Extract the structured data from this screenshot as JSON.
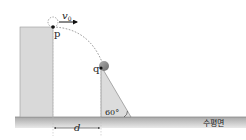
{
  "diagram": {
    "type": "projectile-motion",
    "labels": {
      "launch_point": "p",
      "landing_point": "q",
      "initial_velocity": "v",
      "initial_velocity_subscript": "0",
      "horizontal_distance": "d",
      "incline_angle": "60°",
      "ground": "수평면"
    },
    "colors": {
      "cliff_fill": "#d9d9d9",
      "cliff_edge": "#9a9a9a",
      "incline_fill": "#dcdcdc",
      "ground_top": "#b5b5b5",
      "ground_bottom": "#e6e6e6",
      "ball": "#8c8c8c",
      "trajectory": "#777777",
      "point": "#111111",
      "guide_line": "#bdbdbd"
    },
    "geometry": {
      "cliff": {
        "x": 20,
        "y": 27,
        "width": 33,
        "height": 90
      },
      "point_p": {
        "x": 53,
        "y": 27
      },
      "ball_q": {
        "x": 104,
        "y": 66,
        "r": 5
      },
      "point_q": {
        "x": 101,
        "y": 68
      },
      "incline": {
        "top": [
          101,
          66
        ],
        "bottom_left": [
          101,
          117
        ],
        "bottom_right": [
          131,
          117
        ]
      },
      "ground": {
        "x": 15,
        "y": 117,
        "width": 231,
        "height": 11
      },
      "d_span": {
        "x1": 53,
        "x2": 101,
        "y": 128
      }
    }
  }
}
